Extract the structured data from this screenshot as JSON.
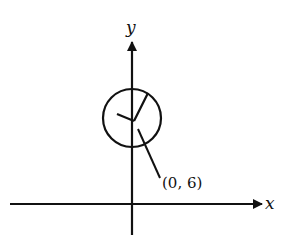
{
  "diagram": {
    "type": "coordinate-plane-clock",
    "axes": {
      "x_label": "x",
      "y_label": "y"
    },
    "circle": {
      "center_label": "(0, 6)",
      "description": "circle with two hands drawn from center, centered on y-axis"
    },
    "annotation": {
      "text": "(0, 6)"
    },
    "colors": {
      "stroke": "#111111",
      "background": "#ffffff"
    }
  }
}
